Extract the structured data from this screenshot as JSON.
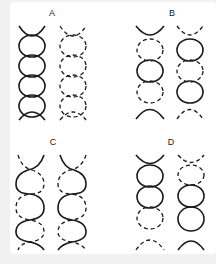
{
  "panels": [
    {
      "label": "A",
      "left_strand": [
        "solid",
        "solid",
        "solid",
        "solid",
        "solid"
      ],
      "right_strand": [
        "dashed",
        "dashed",
        "dashed",
        "dashed",
        "dashed"
      ]
    },
    {
      "label": "B",
      "left_strand": [
        "solid",
        "dashed",
        "solid",
        "dashed",
        "solid"
      ],
      "right_strand": [
        "dashed",
        "solid",
        "dashed",
        "solid",
        "dashed"
      ]
    },
    {
      "label": "C",
      "left_strand": [
        "twisted-solid-dashed"
      ],
      "right_strand": [
        "twisted-solid-dashed"
      ]
    },
    {
      "label": "D",
      "left_strand": [
        "solid",
        "solid",
        "solid",
        "dashed",
        "dashed"
      ],
      "right_strand": [
        "dashed",
        "dashed",
        "solid",
        "solid",
        "solid"
      ]
    }
  ],
  "colors": {
    "stroke": "#1a1a1a",
    "card_background": "#ffffff",
    "page_background": "#f1f1f1"
  }
}
